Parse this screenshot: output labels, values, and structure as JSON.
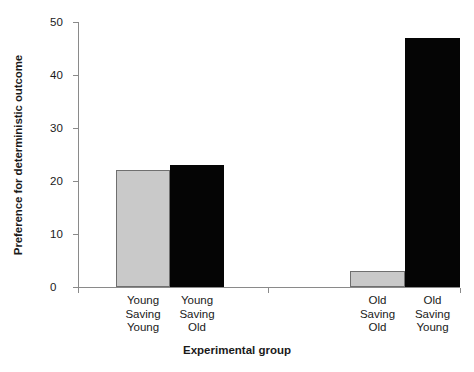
{
  "chart_data": {
    "type": "bar",
    "title": "",
    "xlabel": "Experimental group",
    "ylabel": "Preference for deterministic outcome",
    "categories": [
      "Young\nSaving\nYoung",
      "Young\nSaving\nOld",
      "Old\nSaving\nOld",
      "Old\nSaving\nYoung"
    ],
    "values": [
      22,
      23,
      3,
      47
    ],
    "bar_colors": [
      "#c9c9c9",
      "#050505",
      "#c9c9c9",
      "#050505"
    ],
    "ylim": [
      0,
      50
    ],
    "yticks": [
      0,
      10,
      20,
      30,
      40,
      50
    ],
    "ytick_labels": [
      "0",
      "10",
      "20",
      "30",
      "40",
      "50"
    ],
    "grid": false,
    "legend": "none",
    "axis_color": "#8a8a8a",
    "group_separator_tick": true
  },
  "axes": {
    "y_title": "Preference for deterministic outcome",
    "x_title": "Experimental group"
  },
  "bars": [
    {
      "label": "Young\nSaving\nYoung",
      "value": 22,
      "color": "#c9c9c9",
      "style": "gray",
      "left": 38,
      "width": 54
    },
    {
      "label": "Young\nSaving\nOld",
      "value": 23,
      "color": "#050505",
      "style": "black",
      "left": 92,
      "width": 54
    },
    {
      "label": "Old\nSaving\nOld",
      "value": 3,
      "color": "#c9c9c9",
      "style": "gray",
      "left": 272,
      "width": 55
    },
    {
      "label": "Old\nSaving\nYoung",
      "value": 47,
      "color": "#050505",
      "style": "black",
      "left": 327,
      "width": 55
    }
  ],
  "yticks": [
    {
      "label": "50",
      "value": 50
    },
    {
      "label": "40",
      "value": 40
    },
    {
      "label": "30",
      "value": 30
    },
    {
      "label": "20",
      "value": 20
    },
    {
      "label": "10",
      "value": 10
    },
    {
      "label": "0",
      "value": 0
    }
  ]
}
